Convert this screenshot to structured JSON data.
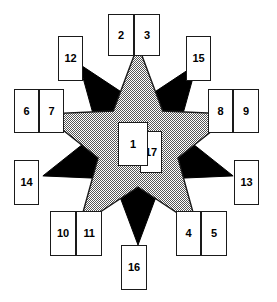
{
  "diagram": {
    "background_color": "#ffffff",
    "gray_star": {
      "name": "gray-dithered-star",
      "fill_color": "#a3a3a3",
      "stroke_color": "#1a1a1a",
      "points": 5,
      "rotation_degrees": 0,
      "center": [
        138,
        145
      ],
      "outer_radius": 100,
      "inner_radius": 42
    },
    "black_star": {
      "name": "black-star",
      "fill_color": "#000000",
      "stroke_color": "#000000",
      "points": 5,
      "rotation_degrees": 36,
      "center": [
        138,
        145
      ],
      "outer_radius": 100,
      "inner_radius": 42
    },
    "boxes": [
      {
        "id": "1",
        "label": "1",
        "x": 118,
        "y": 122,
        "w": 30,
        "h": 44,
        "group": "center-front",
        "z": 30
      },
      {
        "id": "17",
        "label": "17",
        "x": 140,
        "y": 131,
        "w": 22,
        "h": 42,
        "group": "center-back",
        "z": 20
      },
      {
        "id": "2",
        "label": "2",
        "x": 108,
        "y": 14,
        "w": 26,
        "h": 42,
        "group": "top-pair",
        "z": 40
      },
      {
        "id": "3",
        "label": "3",
        "x": 134,
        "y": 14,
        "w": 26,
        "h": 42,
        "group": "top-pair",
        "z": 40
      },
      {
        "id": "12",
        "label": "12",
        "x": 58,
        "y": 36,
        "w": 25,
        "h": 45,
        "group": "upper-left",
        "z": 40
      },
      {
        "id": "15",
        "label": "15",
        "x": 186,
        "y": 36,
        "w": 25,
        "h": 45,
        "group": "upper-right",
        "z": 40
      },
      {
        "id": "6",
        "label": "6",
        "x": 14,
        "y": 89,
        "w": 25,
        "h": 44,
        "group": "left-pair",
        "z": 40
      },
      {
        "id": "7",
        "label": "7",
        "x": 39,
        "y": 89,
        "w": 25,
        "h": 44,
        "group": "left-pair",
        "z": 40
      },
      {
        "id": "8",
        "label": "8",
        "x": 208,
        "y": 89,
        "w": 25,
        "h": 44,
        "group": "right-pair",
        "z": 40
      },
      {
        "id": "9",
        "label": "9",
        "x": 233,
        "y": 89,
        "w": 26,
        "h": 44,
        "group": "right-pair",
        "z": 40
      },
      {
        "id": "14",
        "label": "14",
        "x": 14,
        "y": 160,
        "w": 25,
        "h": 45,
        "group": "lower-left",
        "z": 40
      },
      {
        "id": "13",
        "label": "13",
        "x": 234,
        "y": 160,
        "w": 25,
        "h": 45,
        "group": "lower-right",
        "z": 40
      },
      {
        "id": "10",
        "label": "10",
        "x": 50,
        "y": 211,
        "w": 26,
        "h": 45,
        "group": "bottom-left-pair",
        "z": 40
      },
      {
        "id": "11",
        "label": "11",
        "x": 76,
        "y": 211,
        "w": 26,
        "h": 45,
        "group": "bottom-left-pair",
        "z": 40
      },
      {
        "id": "4",
        "label": "4",
        "x": 176,
        "y": 211,
        "w": 25,
        "h": 45,
        "group": "bottom-right-pair",
        "z": 40
      },
      {
        "id": "5",
        "label": "5",
        "x": 201,
        "y": 211,
        "w": 26,
        "h": 45,
        "group": "bottom-right-pair",
        "z": 40
      },
      {
        "id": "16",
        "label": "16",
        "x": 121,
        "y": 245,
        "w": 26,
        "h": 45,
        "group": "bottom",
        "z": 40
      }
    ]
  }
}
